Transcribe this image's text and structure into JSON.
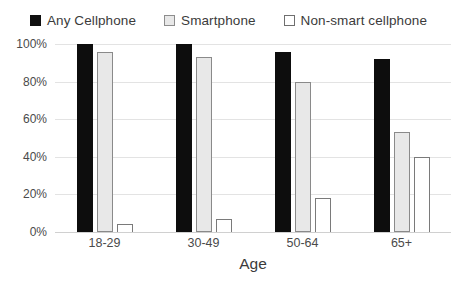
{
  "legend": {
    "position": "top",
    "items": [
      {
        "label": "Any Cellphone",
        "swatch": "black-filled-square",
        "color": "#101010"
      },
      {
        "label": "Smartphone",
        "swatch": "light-gray-square",
        "color": "#e8e8e8"
      },
      {
        "label": "Non-smart cellphone",
        "swatch": "white-outlined-square",
        "color": "#ffffff"
      }
    ]
  },
  "axes": {
    "y_ticks": [
      "100%",
      "80%",
      "60%",
      "40%",
      "20%",
      "0%"
    ],
    "x_title": "Age",
    "x_categories": [
      "18-29",
      "30-49",
      "50-64",
      "65+"
    ]
  },
  "chart_data": {
    "type": "bar",
    "title": "",
    "subtitle": "",
    "xlabel": "Age",
    "ylabel": "",
    "categories": [
      "18-29",
      "30-49",
      "50-64",
      "65+"
    ],
    "series": [
      {
        "name": "Any Cellphone",
        "color": "#101010",
        "values": [
          100,
          100,
          96,
          92
        ]
      },
      {
        "name": "Smartphone",
        "color": "#e8e8e8",
        "values": [
          96,
          93,
          80,
          53
        ]
      },
      {
        "name": "Non-smart cellphone",
        "color": "#ffffff",
        "values": [
          4,
          7,
          18,
          40
        ]
      }
    ],
    "ylim": [
      0,
      100
    ],
    "ytick_values": [
      0,
      20,
      40,
      60,
      80,
      100
    ],
    "ytick_labels": [
      "0%",
      "20%",
      "40%",
      "60%",
      "80%",
      "100%"
    ],
    "grid": true,
    "grid_axis": "y",
    "legend_position": "top",
    "value_labels": false
  }
}
